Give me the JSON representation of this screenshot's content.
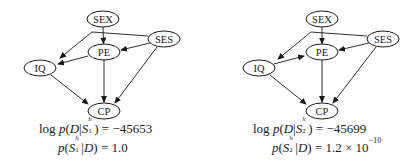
{
  "diagrams": [
    {
      "id": "S1",
      "nodes": [
        {
          "name": "SEX",
          "label": "SEX",
          "cx": 103,
          "cy": 19
        },
        {
          "name": "SES",
          "label": "SES",
          "cx": 164,
          "cy": 39
        },
        {
          "name": "PE",
          "label": "PE",
          "cx": 104,
          "cy": 52
        },
        {
          "name": "IQ",
          "label": "IQ",
          "cx": 40,
          "cy": 68
        },
        {
          "name": "CP",
          "label": "CP",
          "cx": 104,
          "cy": 111
        }
      ],
      "edges": [
        [
          "SEX",
          "PE"
        ],
        [
          "SEX",
          "IQ"
        ],
        [
          "SES",
          "IQ"
        ],
        [
          "SES",
          "PE"
        ],
        [
          "SES",
          "CP"
        ],
        [
          "PE",
          "IQ"
        ],
        [
          "PE",
          "CP"
        ],
        [
          "IQ",
          "CP"
        ]
      ],
      "log_likelihood_label": "log",
      "log_likelihood_value": "−45653",
      "structure_subscript": "1",
      "posterior_value": "1.0",
      "posterior_exponent": ""
    },
    {
      "id": "S2",
      "nodes": [
        {
          "name": "SEX",
          "label": "SEX",
          "cx": 322,
          "cy": 19
        },
        {
          "name": "SES",
          "label": "SES",
          "cx": 383,
          "cy": 39
        },
        {
          "name": "PE",
          "label": "PE",
          "cx": 322,
          "cy": 52
        },
        {
          "name": "IQ",
          "label": "IQ",
          "cx": 259,
          "cy": 68
        },
        {
          "name": "CP",
          "label": "CP",
          "cx": 322,
          "cy": 111
        }
      ],
      "edges": [
        [
          "SEX",
          "PE"
        ],
        [
          "SEX",
          "IQ"
        ],
        [
          "SES",
          "IQ"
        ],
        [
          "SES",
          "PE"
        ],
        [
          "SES",
          "CP"
        ],
        [
          "IQ",
          "PE"
        ],
        [
          "PE",
          "CP"
        ],
        [
          "IQ",
          "CP"
        ]
      ],
      "log_likelihood_label": "log",
      "log_likelihood_value": "−45699",
      "structure_subscript": "2",
      "posterior_value": "1.2 × 10",
      "posterior_exponent": "−10"
    }
  ],
  "text": {
    "p": "p",
    "D": "D",
    "S": "S",
    "h": "h",
    "bar": "|",
    "eq": "="
  }
}
